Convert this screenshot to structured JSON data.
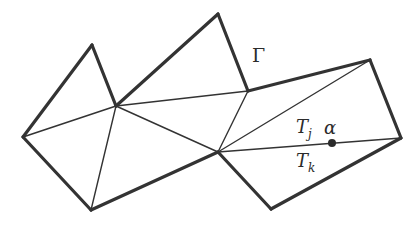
{
  "figure": {
    "colors": {
      "stroke": "#333333",
      "background": "#ffffff",
      "point": "#2b2b2b"
    },
    "vertices": {
      "A": [
        23,
        137
      ],
      "B": [
        92,
        45
      ],
      "C": [
        116,
        106
      ],
      "D": [
        218,
        14
      ],
      "E": [
        248,
        91
      ],
      "F": [
        370,
        60
      ],
      "G": [
        401,
        138
      ],
      "H": [
        271,
        209
      ],
      "I": [
        218,
        152
      ],
      "J": [
        91,
        210
      ]
    },
    "boundary_edges": [
      [
        "A",
        "B"
      ],
      [
        "B",
        "C"
      ],
      [
        "C",
        "D"
      ],
      [
        "D",
        "E"
      ],
      [
        "E",
        "F"
      ],
      [
        "F",
        "G"
      ],
      [
        "G",
        "H"
      ],
      [
        "H",
        "I"
      ],
      [
        "I",
        "J"
      ],
      [
        "J",
        "A"
      ]
    ],
    "interior_edges": [
      [
        "A",
        "C"
      ],
      [
        "C",
        "E"
      ],
      [
        "C",
        "I"
      ],
      [
        "C",
        "J"
      ],
      [
        "E",
        "I"
      ],
      [
        "I",
        "F"
      ],
      [
        "I",
        "G"
      ]
    ],
    "point": {
      "name": "alpha",
      "x": 332,
      "y": 143
    }
  },
  "labels": {
    "boundary": "Γ",
    "triangle_j_main": "T",
    "triangle_j_sub": "j",
    "triangle_k_main": "T",
    "triangle_k_sub": "k",
    "point": "α"
  }
}
